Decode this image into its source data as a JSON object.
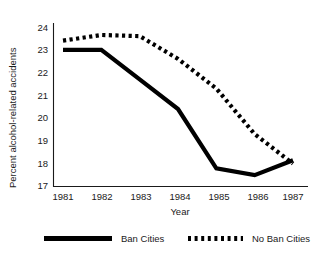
{
  "chart_data": {
    "type": "line",
    "title": "",
    "xlabel": "Year",
    "ylabel": "Percent alcohol-related accidents",
    "categories": [
      "1981",
      "1982",
      "1983",
      "1984",
      "1985",
      "1986",
      "1987"
    ],
    "x": [
      1981,
      1982,
      1983,
      1984,
      1985,
      1986,
      1987
    ],
    "xlim": [
      1981,
      1987
    ],
    "ylim": [
      17,
      24
    ],
    "yticks": [
      17,
      18,
      19,
      20,
      21,
      22,
      23,
      24
    ],
    "ytick_labels": [
      "17",
      "18",
      "19",
      "20",
      "21",
      "22",
      "23",
      "24"
    ],
    "grid": false,
    "legend_position": "bottom",
    "series": [
      {
        "name": "Ban Cities",
        "style": "solid",
        "color": "#000000",
        "values": [
          23.0,
          23.0,
          21.7,
          20.4,
          17.8,
          17.5,
          18.15
        ]
      },
      {
        "name": "No Ban Cities",
        "style": "dotted",
        "color": "#000000",
        "values": [
          23.4,
          23.65,
          23.6,
          22.6,
          21.3,
          19.3,
          18.0
        ]
      }
    ]
  },
  "legend": {
    "items": [
      {
        "label": "Ban Cities",
        "marker": "solid-line-swatch"
      },
      {
        "label": "No Ban Cities",
        "marker": "dotted-line-swatch"
      }
    ]
  }
}
